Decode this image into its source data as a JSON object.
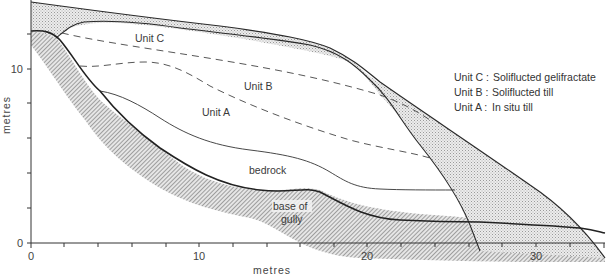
{
  "figure": {
    "type": "geological cross-section",
    "x_axis": {
      "title": "metres",
      "ticks": [
        "0",
        "10",
        "20",
        "30"
      ],
      "range": [
        0,
        34
      ]
    },
    "y_axis": {
      "title": "metres",
      "ticks": [
        "0",
        "10"
      ],
      "range": [
        0,
        14
      ]
    },
    "labels": {
      "unit_c": "Unit C",
      "unit_b": "Unit B",
      "unit_a": "Unit A",
      "bedrock": "bedrock",
      "base_of_gully_1": "base of",
      "base_of_gully_2": "gully"
    },
    "legend": [
      {
        "unit": "Unit C :",
        "description": "Soliflucted gelifractate"
      },
      {
        "unit": "Unit B :",
        "description": "Soliflucted till"
      },
      {
        "unit": "Unit A :",
        "description": "In situ till"
      }
    ],
    "colors": {
      "line": "#2a2a2a",
      "stipple_fill": "#d8d8d8",
      "hatch": "#7a7a7a"
    }
  }
}
